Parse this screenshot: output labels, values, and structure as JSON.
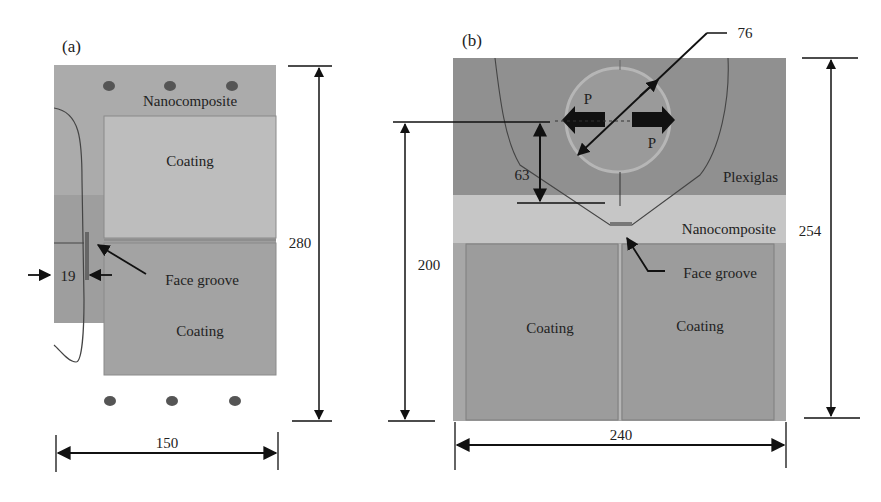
{
  "panel_a": {
    "label": "(a)",
    "material_top": "Nanocomposite",
    "coating_top": "Coating",
    "coating_bottom": "Coating",
    "groove_label": "Face groove",
    "dim_height": "280",
    "dim_width": "150",
    "dim_groove": "19"
  },
  "panel_b": {
    "label": "(b)",
    "plexiglas_label": "Plexiglas",
    "material_label": "Nanocomposite",
    "groove_label": "Face groove",
    "coating_left": "Coating",
    "coating_right": "Coating",
    "load_left": "P",
    "load_right": "P",
    "dim_diameter": "76",
    "dim_63": "63",
    "dim_200": "200",
    "dim_height": "254",
    "dim_width": "240"
  },
  "colors": {
    "nanocomposite_a": "#a9a9a9",
    "coating_a_top": "#b5b5b5",
    "coating_a_bottom": "#9a9a9a",
    "plexiglas": "#8f8f8f",
    "nanocomposite_b": "#c4c4c4",
    "coating_b": "#9b9b9b",
    "dim_line": "#111111"
  }
}
